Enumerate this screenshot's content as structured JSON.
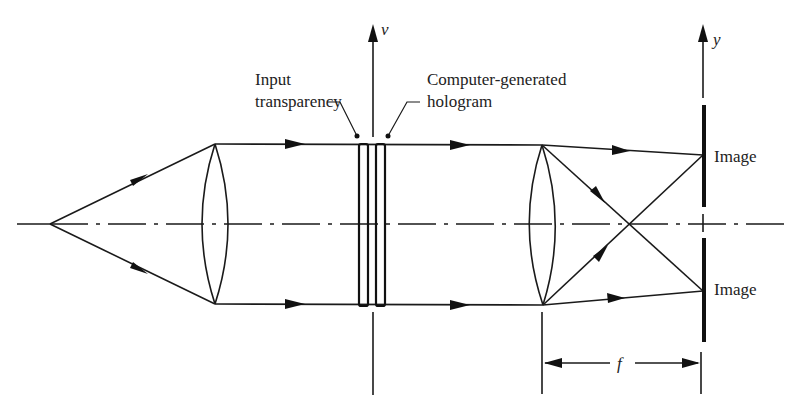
{
  "diagram": {
    "title": "",
    "type": "optical-system",
    "labels": {
      "v_axis": "v",
      "y_axis": "y",
      "input_transparency_line1": "Input",
      "input_transparency_line2": "transparency",
      "hologram_line1": "Computer-generated",
      "hologram_line2": "hologram",
      "image_top": "Image",
      "image_bottom": "Image",
      "focal_length": "f"
    },
    "components": [
      {
        "id": "point-source",
        "label": "",
        "x": 50,
        "y": 224
      },
      {
        "id": "collimating-lens",
        "label": "",
        "x": 215
      },
      {
        "id": "input-transparency",
        "label": "Input transparency",
        "x": 363
      },
      {
        "id": "computer-generated-hologram",
        "label": "Computer-generated hologram",
        "x": 380
      },
      {
        "id": "transform-lens",
        "label": "",
        "x": 542
      },
      {
        "id": "image-plane",
        "label": "y",
        "x": 703
      }
    ],
    "colors": {
      "stroke": "#1a1a1a",
      "background": "#ffffff"
    }
  }
}
